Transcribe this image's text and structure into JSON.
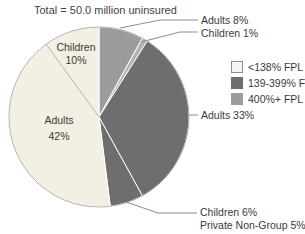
{
  "chart_data": {
    "type": "pie",
    "title": "Total = 50.0 million uninsured",
    "start": "12 o'clock, clockwise",
    "slices": [
      {
        "label": "Adults",
        "value": 8,
        "display": "Adults 8%",
        "group": "400%+ FPL",
        "color": "#9c9c9c"
      },
      {
        "label": "Children",
        "value": 1,
        "display": "Children 1%",
        "group": "400%+ FPL",
        "color": "#b2b2b2"
      },
      {
        "label": "Adults",
        "value": 33,
        "display": "Adults 33%",
        "group": "139-399% FPL",
        "color": "#6e6e6e"
      },
      {
        "label": "Children",
        "value": 6,
        "display": "Children 6%",
        "group": "139-399% FPL",
        "color": "#6e6e6e"
      },
      {
        "label": "Adults",
        "value": 42,
        "display": "Adults 42%",
        "group": "<138% FPL",
        "color": "#f3f0e3"
      },
      {
        "label": "Children",
        "value": 10,
        "display": "Children 10%",
        "group": "<138% FPL",
        "color": "#f3f0e3"
      }
    ],
    "legend": [
      {
        "label": "<138% FPL",
        "color": "#f7f5ee",
        "border": "#8f8f8f"
      },
      {
        "label": "139-399% FPL",
        "color": "#6e6e6e",
        "border": "#6e6e6e"
      },
      {
        "label": "400%+ FPL",
        "color": "#9c9c9c",
        "border": "#9c9c9c"
      }
    ],
    "legend_position": "right"
  },
  "pie_labels": {
    "children10": {
      "name": "Children",
      "pct": "10%"
    },
    "adults42": {
      "name": "Adults",
      "pct": "42%"
    }
  },
  "callouts": {
    "adults8": "Adults 8%",
    "children1": "Children 1%",
    "adults33": "Adults 33%",
    "children6": "Children 6%",
    "private_nongroup": "Private Non-Group 5%"
  }
}
